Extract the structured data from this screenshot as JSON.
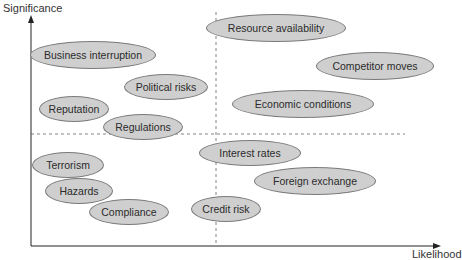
{
  "chart_data": {
    "type": "scatter",
    "title": "",
    "xlabel": "Likelihood",
    "ylabel": "Significance",
    "quadrant_dividers": {
      "vertical_x": 216,
      "horizontal_y": 134
    },
    "colors": {
      "ellipse_fill": "#cfcfcf",
      "ellipse_stroke": "#7a7a7a",
      "axis": "#222222",
      "divider": "#666666"
    },
    "risks": [
      {
        "label": "Business interruption",
        "cx": 93,
        "cy": 55,
        "w": 126,
        "h": 28,
        "quadrant": "high significance / low likelihood"
      },
      {
        "label": "Political risks",
        "cx": 166,
        "cy": 87,
        "w": 84,
        "h": 26,
        "quadrant": "high significance / low likelihood"
      },
      {
        "label": "Reputation",
        "cx": 74,
        "cy": 109,
        "w": 70,
        "h": 26,
        "quadrant": "high significance / low likelihood"
      },
      {
        "label": "Regulations",
        "cx": 143,
        "cy": 127,
        "w": 80,
        "h": 26,
        "quadrant": "high significance / low likelihood"
      },
      {
        "label": "Resource availability",
        "cx": 276,
        "cy": 28,
        "w": 140,
        "h": 28,
        "quadrant": "high significance / high likelihood"
      },
      {
        "label": "Competitor moves",
        "cx": 375,
        "cy": 66,
        "w": 118,
        "h": 28,
        "quadrant": "high significance / high likelihood"
      },
      {
        "label": "Economic conditions",
        "cx": 303,
        "cy": 104,
        "w": 142,
        "h": 28,
        "quadrant": "high significance / high likelihood"
      },
      {
        "label": "Terrorism",
        "cx": 68,
        "cy": 165,
        "w": 72,
        "h": 26,
        "quadrant": "low significance / low likelihood"
      },
      {
        "label": "Hazards",
        "cx": 79,
        "cy": 191,
        "w": 68,
        "h": 26,
        "quadrant": "low significance / low likelihood"
      },
      {
        "label": "Compliance",
        "cx": 129,
        "cy": 212,
        "w": 80,
        "h": 26,
        "quadrant": "low significance / low likelihood"
      },
      {
        "label": "Interest rates",
        "cx": 250,
        "cy": 153,
        "w": 102,
        "h": 26,
        "quadrant": "low significance / high likelihood"
      },
      {
        "label": "Foreign exchange",
        "cx": 315,
        "cy": 181,
        "w": 122,
        "h": 28,
        "quadrant": "low significance / high likelihood"
      },
      {
        "label": "Credit risk",
        "cx": 226,
        "cy": 209,
        "w": 70,
        "h": 26,
        "quadrant": "low significance / high likelihood"
      }
    ]
  }
}
